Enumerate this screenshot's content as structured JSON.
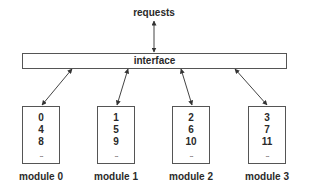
{
  "diagram": {
    "requests_label": "requests",
    "interface_label": "interface",
    "modules": [
      {
        "label": "module 0",
        "values": [
          "0",
          "4",
          "8"
        ],
        "ellipsis": "..."
      },
      {
        "label": "module 1",
        "values": [
          "1",
          "5",
          "9"
        ],
        "ellipsis": "..."
      },
      {
        "label": "module 2",
        "values": [
          "2",
          "6",
          "10"
        ],
        "ellipsis": "..."
      },
      {
        "label": "module 3",
        "values": [
          "3",
          "7",
          "11"
        ],
        "ellipsis": "..."
      }
    ],
    "colors": {
      "line": "#555555",
      "text": "#2a2a2a",
      "background": "#ffffff"
    }
  }
}
